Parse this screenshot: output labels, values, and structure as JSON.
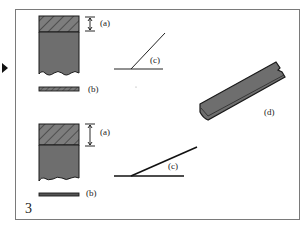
{
  "figure": {
    "number": "3",
    "labels": {
      "a_top": "(a)",
      "b_top": "(b)",
      "c_top": "(c)",
      "d": "(d)",
      "a_bottom": "(a)",
      "b_bottom": "(b)",
      "c_bottom": "(c)"
    },
    "colors": {
      "block_fill": "#6e6e6e",
      "hatch_fill": "#7d7d7d",
      "outline": "#1a1a1a",
      "frame": "#7a7a7a",
      "strip_fill": "#6a6a6a"
    },
    "descriptions": {
      "top_block": "cross-section block with hatched upper layer of thickness (a) and wavy torn bottom edge",
      "top_strip": "thin hatched strip (b)",
      "top_angle": "steep angle (c)",
      "strip_d": "tilted flat strip (d) with torn end",
      "bottom_block": "cross-section block with thicker hatched upper layer (a)",
      "bottom_strip": "thin strip (b)",
      "bottom_angle": "shallow angle (c)"
    }
  }
}
